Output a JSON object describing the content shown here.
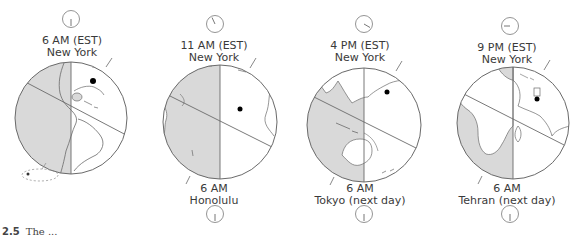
{
  "figure": {
    "caption_number": "2.5",
    "caption_text": "The ..."
  },
  "colors": {
    "night_shade": "#d9d9d9",
    "outline": "#6a6a6a",
    "day": "#ffffff",
    "marker": "#000000"
  },
  "panels": [
    {
      "top_time": "6 AM (EST)",
      "top_city": "New York",
      "top_clock_hour": 6,
      "bottom_time": "",
      "bottom_city": "",
      "bottom_clock_hour": null,
      "region": "Americas"
    },
    {
      "top_time": "11 AM (EST)",
      "top_city": "New York",
      "top_clock_hour": 11,
      "bottom_time": "6 AM",
      "bottom_city": "Honolulu",
      "bottom_clock_hour": 6,
      "region": "Pacific"
    },
    {
      "top_time": "4 PM (EST)",
      "top_city": "New York",
      "top_clock_hour": 4,
      "bottom_time": "6 AM",
      "bottom_city": "Tokyo (next day)",
      "bottom_clock_hour": 6,
      "region": "East Asia / Australia"
    },
    {
      "top_time": "9 PM (EST)",
      "top_city": "New York",
      "top_clock_hour": 9,
      "bottom_time": "6 AM",
      "bottom_city": "Tehran (next day)",
      "bottom_clock_hour": 6,
      "region": "Africa / Asia"
    }
  ]
}
